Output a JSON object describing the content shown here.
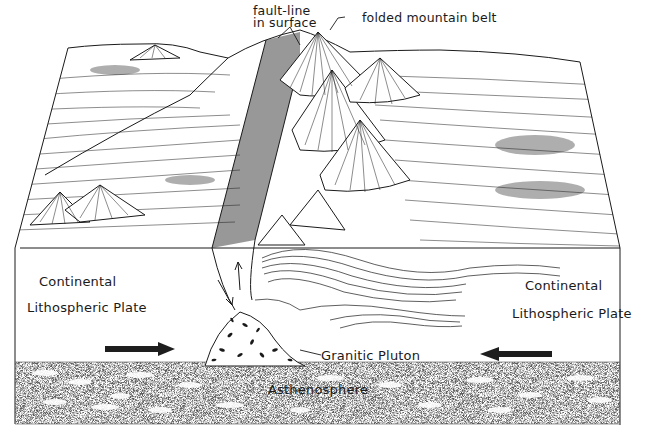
{
  "diagram": {
    "type": "geologic block diagram",
    "colors": {
      "ink": "#1a1a1a",
      "paper": "#ffffff",
      "asthenosphere_stipple": "#8a8a8a",
      "arrow_fill": "#1e1e1e"
    },
    "labels": {
      "fault_line_1": "fault-line",
      "fault_line_2": "in surface",
      "folded_mountain_belt": "folded mountain belt",
      "left_plate_1": "Continental",
      "left_plate_2": "Lithospheric Plate",
      "right_plate_1": "Continental",
      "right_plate_2": "Lithospheric Plate",
      "granitic_pluton": "Granitic Pluton",
      "asthenosphere": "Asthenosphere"
    },
    "arrows": [
      {
        "name": "left-plate-motion",
        "direction": "right"
      },
      {
        "name": "right-plate-motion",
        "direction": "left"
      }
    ]
  }
}
